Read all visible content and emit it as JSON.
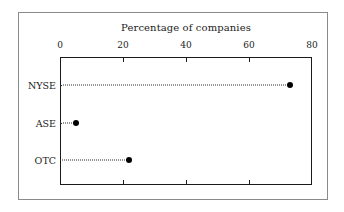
{
  "chart_data": {
    "type": "scatter",
    "subtype": "dot-plot",
    "title": "Percentage of companies",
    "xlabel": "",
    "ylabel": "",
    "categories": [
      "NYSE",
      "ASE",
      "OTC"
    ],
    "values": [
      73,
      5,
      22
    ],
    "xlim": [
      0,
      80
    ],
    "xticks": [
      0,
      20,
      40,
      60,
      80
    ],
    "xtick_labels": [
      "0",
      "20",
      "40",
      "60",
      "80"
    ],
    "grid": false,
    "legend": false,
    "axis_position": "top",
    "leader_lines": "dotted",
    "marker": "filled-circle",
    "marker_color": "#000000",
    "frame_color": "#1b1b1b",
    "outer_frame_color": "#8a8a8a",
    "background": "#ffffff"
  }
}
